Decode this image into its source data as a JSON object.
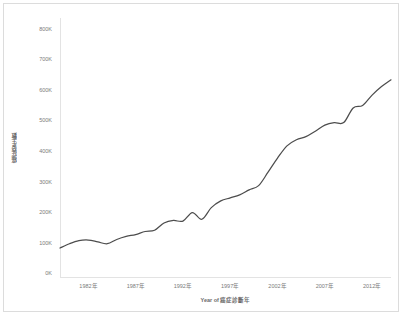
{
  "chart_data": {
    "type": "line",
    "title": "",
    "xlabel": "Year of 癌症診斷年",
    "ylabel": "癌症發生數",
    "ylim": [
      0,
      850000
    ],
    "xlim": [
      1979,
      2014
    ],
    "grid": false,
    "legend": "none",
    "line_color": "#4d4d4d",
    "ytick_labels": [
      "800K",
      "700K",
      "600K",
      "500K",
      "400K",
      "300K",
      "200K",
      "100K",
      "0K"
    ],
    "ytick_values": [
      800000,
      700000,
      600000,
      500000,
      400000,
      300000,
      200000,
      100000,
      0
    ],
    "xtick_labels": [
      "1982年",
      "1987年",
      "1992年",
      "1997年",
      "2002年",
      "2007年",
      "2012年"
    ],
    "xtick_values": [
      1982,
      1987,
      1992,
      1997,
      2002,
      2007,
      2012
    ],
    "series": [
      {
        "name": "癌症發生數",
        "x": [
          1979,
          1980,
          1981,
          1982,
          1983,
          1984,
          1985,
          1986,
          1987,
          1988,
          1989,
          1990,
          1991,
          1992,
          1993,
          1994,
          1995,
          1996,
          1997,
          1998,
          1999,
          2000,
          2001,
          2002,
          2003,
          2004,
          2005,
          2006,
          2007,
          2008,
          2009,
          2010,
          2011,
          2012,
          2013,
          2014
        ],
        "values": [
          98000,
          112000,
          122000,
          124000,
          118000,
          112000,
          126000,
          136000,
          142000,
          152000,
          156000,
          180000,
          188000,
          186000,
          214000,
          192000,
          230000,
          252000,
          262000,
          272000,
          288000,
          302000,
          346000,
          392000,
          432000,
          452000,
          462000,
          480000,
          500000,
          508000,
          508000,
          556000,
          564000,
          598000,
          626000,
          648000
        ]
      }
    ]
  },
  "axes": {
    "y_title": "癌症發生數",
    "x_title": "Year of 癌症診斷年"
  }
}
